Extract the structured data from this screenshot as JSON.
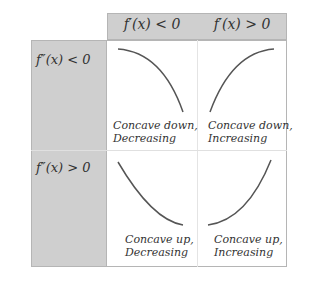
{
  "columns": [
    "f′(x) < 0",
    "f′(x) > 0"
  ],
  "rows": [
    "f″(x) < 0",
    "f″(x) > 0"
  ],
  "cells": {
    "r0c0": [
      "Concave down,",
      "Decreasing"
    ],
    "r0c1": [
      "Concave down,",
      "Increasing"
    ],
    "r1c0": [
      "Concave up,",
      "Decreasing"
    ],
    "r1c1": [
      "Concave up,",
      "Increasing"
    ]
  }
}
